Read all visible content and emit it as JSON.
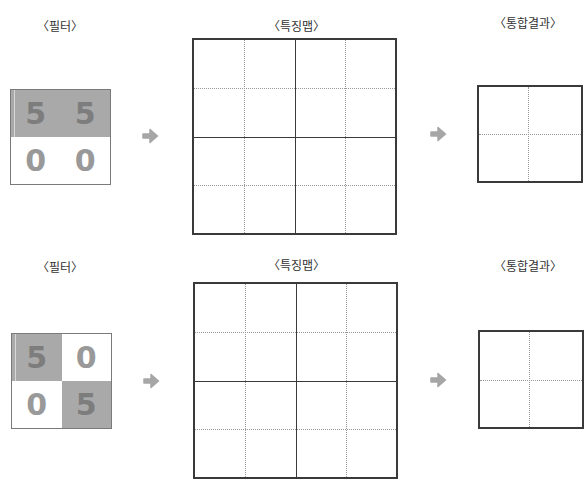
{
  "rows": [
    {
      "filter_label": "〈필터〉",
      "feature_map_label": "〈특징맵〉",
      "result_label": "〈통합결과〉",
      "filter": {
        "cells": [
          {
            "value": "5",
            "shaded": true
          },
          {
            "value": "5",
            "shaded": true
          },
          {
            "value": "0",
            "shaded": false
          },
          {
            "value": "0",
            "shaded": false
          }
        ]
      },
      "feature_map": {
        "size": 4,
        "values": []
      },
      "result": {
        "size": 2,
        "values": []
      }
    },
    {
      "filter_label": "〈필터〉",
      "feature_map_label": "〈특징맵〉",
      "result_label": "〈통합결과〉",
      "filter": {
        "cells": [
          {
            "value": "5",
            "shaded": true
          },
          {
            "value": "0",
            "shaded": false
          },
          {
            "value": "0",
            "shaded": false
          },
          {
            "value": "5",
            "shaded": true
          }
        ]
      },
      "feature_map": {
        "size": 4,
        "values": []
      },
      "result": {
        "size": 2,
        "values": []
      }
    }
  ],
  "colors": {
    "shaded_cell": "#a9a9a9",
    "digit": "#8a8a8a",
    "arrow": "#a6a6a6",
    "grid_border": "#3a3a3a",
    "dotted_line": "#999999"
  }
}
